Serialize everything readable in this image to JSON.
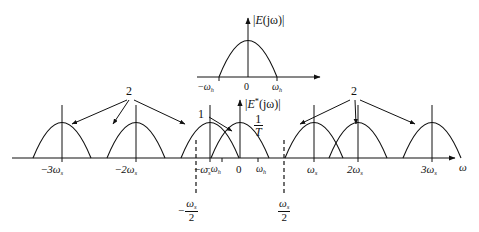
{
  "figure": {
    "type": "diagram",
    "axis_label": "ω",
    "line_color": "#111111",
    "background": "#ffffff"
  },
  "top_plot": {
    "title_bar": "|",
    "title_E": "E",
    "title_arg": "(jω)",
    "title_bar2": "|",
    "ticks": [
      {
        "name": "neg-omega-h",
        "minus": "−",
        "sym": "ω",
        "sub": "h"
      },
      {
        "name": "zero",
        "text": "0"
      },
      {
        "name": "pos-omega-h",
        "sym": "ω",
        "sub": "h"
      }
    ]
  },
  "bottom_plot": {
    "title_bar": "|",
    "title_E": "E",
    "title_star": "*",
    "title_arg": "(jω)",
    "title_bar2": "|",
    "amplitude_num": "1",
    "amplitude_den": "T",
    "ticks": [
      {
        "name": "tick-neg-3ws",
        "minus": "−",
        "coef": "3",
        "sym": "ω",
        "sub": "s"
      },
      {
        "name": "tick-neg-2ws",
        "minus": "−",
        "coef": "2",
        "sym": "ω",
        "sub": "s"
      },
      {
        "name": "tick-neg-ws",
        "minus": "−",
        "coef": "",
        "sym": "ω",
        "sub": "s"
      },
      {
        "name": "tick-neg-wh",
        "minus": "−",
        "coef": "",
        "sym": "ω",
        "sub": "h"
      },
      {
        "name": "tick-zero",
        "text": "0"
      },
      {
        "name": "tick-pos-wh",
        "minus": "",
        "coef": "",
        "sym": "ω",
        "sub": "h"
      },
      {
        "name": "tick-pos-ws",
        "minus": "",
        "coef": "",
        "sym": "ω",
        "sub": "s"
      },
      {
        "name": "tick-pos-2ws",
        "minus": "",
        "coef": "2",
        "sym": "ω",
        "sub": "s"
      },
      {
        "name": "tick-pos-3ws",
        "minus": "",
        "coef": "3",
        "sym": "ω",
        "sub": "s"
      }
    ],
    "dashed_labels": [
      {
        "name": "neg-half-ws",
        "minus": "−",
        "num_sym": "ω",
        "num_sub": "s",
        "den": "2"
      },
      {
        "name": "pos-half-ws",
        "minus": "",
        "num_sym": "ω",
        "num_sub": "s",
        "den": "2"
      }
    ]
  },
  "annotations": [
    {
      "name": "callout-left-2",
      "text": "2"
    },
    {
      "name": "callout-center-1",
      "text": "1"
    },
    {
      "name": "callout-right-2",
      "text": "2"
    }
  ]
}
